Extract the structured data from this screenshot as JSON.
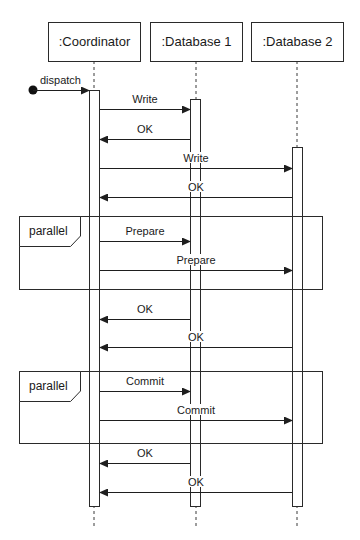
{
  "participants": [
    {
      "label": ":Coordinator"
    },
    {
      "label": ":Database 1"
    },
    {
      "label": ":Database 2"
    }
  ],
  "found_message": {
    "label": "dispatch"
  },
  "messages": [
    {
      "label": "Write",
      "from": "Coordinator",
      "to": "Database 1",
      "kind": "call"
    },
    {
      "label": "OK",
      "from": "Database 1",
      "to": "Coordinator",
      "kind": "reply"
    },
    {
      "label": "Write",
      "from": "Coordinator",
      "to": "Database 2",
      "kind": "call"
    },
    {
      "label": "OK",
      "from": "Database 2",
      "to": "Coordinator",
      "kind": "reply"
    },
    {
      "label": "Prepare",
      "from": "Coordinator",
      "to": "Database 1",
      "kind": "call"
    },
    {
      "label": "Prepare",
      "from": "Coordinator",
      "to": "Database 2",
      "kind": "call"
    },
    {
      "label": "OK",
      "from": "Database 1",
      "to": "Coordinator",
      "kind": "reply"
    },
    {
      "label": "OK",
      "from": "Database 2",
      "to": "Coordinator",
      "kind": "reply"
    },
    {
      "label": "Commit",
      "from": "Coordinator",
      "to": "Database 1",
      "kind": "call"
    },
    {
      "label": "Commit",
      "from": "Coordinator",
      "to": "Database 2",
      "kind": "call"
    },
    {
      "label": "OK",
      "from": "Database 1",
      "to": "Coordinator",
      "kind": "reply"
    },
    {
      "label": "OK",
      "from": "Database 2",
      "to": "Coordinator",
      "kind": "reply"
    }
  ],
  "fragments": [
    {
      "operator": "parallel",
      "contains": [
        "Prepare",
        "Prepare"
      ]
    },
    {
      "operator": "parallel",
      "contains": [
        "Commit",
        "Commit"
      ]
    }
  ],
  "colors": {
    "stroke": "#2a2a2a",
    "background": "#ffffff",
    "text": "#1a1a1a"
  }
}
